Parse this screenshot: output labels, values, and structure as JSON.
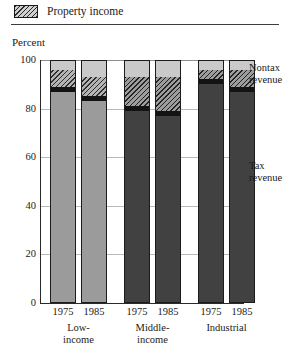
{
  "legend": {
    "swatch_icon": "diagonal-hatch-swatch",
    "label": "Property income"
  },
  "axis": {
    "y_title": "Percent",
    "y_ticks": [
      "100",
      "80",
      "60",
      "40",
      "20",
      "0"
    ]
  },
  "annotations": {
    "nontax": "Nontax\nrevenue",
    "nontax_line1": "Nontax",
    "nontax_line2": "revenue",
    "tax_line1": "Tax",
    "tax_line2": "revenue"
  },
  "groups": [
    {
      "name_line1": "Low-",
      "name_line2": "income",
      "years": [
        "1975",
        "1985"
      ]
    },
    {
      "name_line1": "Middle-",
      "name_line2": "income",
      "years": [
        "1975",
        "1985"
      ]
    },
    {
      "name_line1": "Industrial",
      "name_line2": "",
      "years": [
        "1975",
        "1985"
      ]
    }
  ],
  "colors": {
    "tax_light": "#9b9b9b",
    "tax_dark": "#414141",
    "band": "#131313",
    "nontax": "#c9c9c9",
    "hatch_line": "#2f2f2f",
    "outline": "#1c1c1c",
    "gridline": "#b9b9b9"
  },
  "chart_data": {
    "type": "bar",
    "subtype": "stacked-column",
    "title": "",
    "xlabel": "",
    "ylabel": "Percent",
    "ylim": [
      0,
      100
    ],
    "yticks": [
      0,
      20,
      40,
      60,
      80,
      100
    ],
    "grid": true,
    "legend": [
      "Property income"
    ],
    "legend_position": "top-left",
    "annotations": [
      "Nontax revenue",
      "Tax revenue"
    ],
    "categories": [
      "Low-income 1975",
      "Low-income 1985",
      "Middle-income 1975",
      "Middle-income 1985",
      "Industrial 1975",
      "Industrial 1985"
    ],
    "group_labels": [
      "Low-income",
      "Middle-income",
      "Industrial"
    ],
    "years": [
      "1975",
      "1985"
    ],
    "series": [
      {
        "name": "Tax revenue",
        "values": [
          87,
          83,
          79,
          77,
          90,
          87
        ]
      },
      {
        "name": "Dark band",
        "values": [
          2,
          2,
          2,
          2,
          2,
          2
        ]
      },
      {
        "name": "Property income",
        "values": [
          7,
          8,
          12,
          14,
          4,
          7
        ]
      },
      {
        "name": "Nontax revenue",
        "values": [
          4,
          7,
          7,
          7,
          4,
          4
        ]
      }
    ],
    "bars": [
      {
        "group": "Low-income",
        "year": "1975",
        "tax": 87,
        "band": 2,
        "property": 7,
        "nontax": 4,
        "tone": "light"
      },
      {
        "group": "Low-income",
        "year": "1985",
        "tax": 83,
        "band": 2,
        "property": 8,
        "nontax": 7,
        "tone": "light"
      },
      {
        "group": "Middle-income",
        "year": "1975",
        "tax": 79,
        "band": 2,
        "property": 12,
        "nontax": 7,
        "tone": "dark"
      },
      {
        "group": "Middle-income",
        "year": "1985",
        "tax": 77,
        "band": 2,
        "property": 14,
        "nontax": 7,
        "tone": "dark"
      },
      {
        "group": "Industrial",
        "year": "1975",
        "tax": 90,
        "band": 2,
        "property": 4,
        "nontax": 4,
        "tone": "dark"
      },
      {
        "group": "Industrial",
        "year": "1985",
        "tax": 87,
        "band": 2,
        "property": 7,
        "nontax": 4,
        "tone": "dark"
      }
    ]
  }
}
